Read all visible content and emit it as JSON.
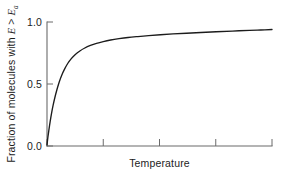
{
  "chart_data": {
    "type": "line",
    "title": "",
    "subtitle": "",
    "xlabel": "Temperature",
    "ylabel_plain": "Fraction of molecules with E > Ea",
    "ylabel_parts": {
      "lead": "Fraction of molecules with ",
      "var_e": "E",
      "relation": " > ",
      "var_ea": "E",
      "var_ea_sub": "a"
    },
    "xtick_labels": [
      "",
      "",
      "",
      "",
      ""
    ],
    "ytick_labels": [
      "0.0",
      "0.5",
      "1.0"
    ],
    "ytick_values": [
      0.0,
      0.5,
      1.0
    ],
    "ylim": [
      0.0,
      1.04
    ],
    "xlim": [
      0,
      1
    ],
    "grid": false,
    "legend": false,
    "legend_position": "none",
    "n_xticks": 5,
    "series": [
      {
        "name": "Fraction of molecules with E > Ea",
        "color": "#1c1c1c",
        "x": [
          0.0,
          0.004,
          0.009,
          0.014,
          0.02,
          0.027,
          0.035,
          0.044,
          0.054,
          0.065,
          0.078,
          0.092,
          0.108,
          0.126,
          0.146,
          0.168,
          0.193,
          0.22,
          0.25,
          0.283,
          0.32,
          0.36,
          0.404,
          0.452,
          0.504,
          0.56,
          0.62,
          0.684,
          0.752,
          0.824,
          0.9,
          0.95,
          1.0
        ],
        "y": [
          0.01,
          0.075,
          0.142,
          0.205,
          0.272,
          0.34,
          0.407,
          0.472,
          0.535,
          0.592,
          0.645,
          0.692,
          0.733,
          0.768,
          0.797,
          0.822,
          0.843,
          0.861,
          0.876,
          0.889,
          0.9,
          0.91,
          0.918,
          0.926,
          0.933,
          0.94,
          0.946,
          0.952,
          0.958,
          0.964,
          0.97,
          0.973,
          0.977
        ]
      }
    ],
    "colors": {
      "curve": "#1c1c1c",
      "axis": "#6b6b6b",
      "text": "#1c1c1c",
      "background": "#ffffff"
    },
    "geometry": {
      "plot_left": 47,
      "plot_right": 272,
      "plot_top": 22,
      "plot_bottom": 146
    }
  }
}
